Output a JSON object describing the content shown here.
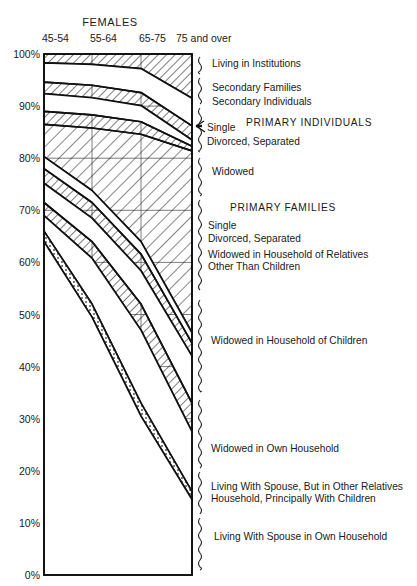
{
  "chart_title": "FEMALES",
  "axis": {
    "x_categories": [
      "45-54",
      "55-64",
      "65-75",
      "75 and over"
    ],
    "y_ticks": [
      "100%",
      "90%",
      "80%",
      "70%",
      "60%",
      "50%",
      "40%",
      "30%",
      "20%",
      "10%",
      "0%"
    ],
    "ylim": [
      0,
      100
    ],
    "grid": true
  },
  "annotations": {
    "living_in_institutions": "Living in Institutions",
    "secondary_families": "Secondary Families",
    "secondary_individuals": "Secondary Individuals",
    "group_primary_individuals": "PRIMARY  INDIVIDUALS",
    "pi_single": "Single",
    "pi_divorced": "Divorced, Separated",
    "pi_widowed": "Widowed",
    "group_primary_families": "PRIMARY  FAMILIES",
    "pf_single": "Single",
    "pf_divorced": "Divorced, Separated",
    "pf_widowed_rel_1": "Widowed in Household of Relatives",
    "pf_widowed_rel_2": "Other Than Children",
    "pf_widowed_children": "Widowed in Household of Children",
    "pf_widowed_own": "Widowed in Own Household",
    "pf_spouse_other_1": "Living With Spouse, But in Other Relatives",
    "pf_spouse_other_2": "Household, Principally With Children",
    "pf_spouse_own": "Living With Spouse in Own Household"
  },
  "chart_data": {
    "type": "area",
    "title": "FEMALES",
    "xlabel": "",
    "ylabel": "",
    "ylim": [
      0,
      100
    ],
    "grid": true,
    "legend_position": "right",
    "x": [
      "45-54",
      "55-64",
      "65-75",
      "75 and over"
    ],
    "note": "Stacked cumulative percent distribution of living arrangements of females by age group. Boundary values are cumulative percentages measured from 0% at bottom.",
    "boundaries_cumulative": [
      {
        "name": "top",
        "values": [
          100,
          100,
          100,
          100
        ]
      },
      {
        "name": "below Living in Institutions",
        "values": [
          98.3,
          98.0,
          97.2,
          91.5
        ]
      },
      {
        "name": "below Secondary Families",
        "values": [
          94.6,
          94.0,
          92.6,
          86.2
        ]
      },
      {
        "name": "below Secondary Individuals",
        "values": [
          92.4,
          91.6,
          90.1,
          83.5
        ]
      },
      {
        "name": "below PI Single",
        "values": [
          89.0,
          88.3,
          87.0,
          82.3
        ]
      },
      {
        "name": "below PI Divorced, Separated",
        "values": [
          86.5,
          85.8,
          84.6,
          81.4
        ]
      },
      {
        "name": "below PI Widowed",
        "values": [
          80.3,
          73.8,
          64.0,
          46.5
        ]
      },
      {
        "name": "below PF Single",
        "values": [
          78.0,
          71.5,
          61.6,
          44.5
        ]
      },
      {
        "name": "below PF Divorced, Separated",
        "values": [
          75.2,
          68.5,
          58.4,
          42.0
        ]
      },
      {
        "name": "below PF Widowed in Household of Relatives Other Than Children",
        "values": [
          71.5,
          64.0,
          52.0,
          33.0
        ]
      },
      {
        "name": "below PF Widowed in Household of Children",
        "values": [
          69.0,
          60.8,
          47.0,
          27.5
        ]
      },
      {
        "name": "below PF Widowed in Own Household",
        "values": [
          66.0,
          52.0,
          33.0,
          16.0
        ]
      },
      {
        "name": "below PF Living With Spouse But in Other Relatives Household",
        "values": [
          64.0,
          49.5,
          30.5,
          14.5
        ]
      },
      {
        "name": "bottom (Living With Spouse in Own Household)",
        "values": [
          0,
          0,
          0,
          0
        ]
      }
    ],
    "series": [
      {
        "name": "Living in Institutions",
        "values": [
          1.7,
          2.0,
          2.8,
          8.5
        ],
        "fill": "hatch"
      },
      {
        "name": "Secondary Families",
        "values": [
          3.7,
          4.0,
          4.6,
          5.3
        ],
        "fill": "blank"
      },
      {
        "name": "Secondary Individuals",
        "values": [
          2.2,
          2.4,
          2.5,
          2.7
        ],
        "fill": "hatch"
      },
      {
        "name": "Primary Individuals - Single",
        "values": [
          3.4,
          3.3,
          3.1,
          1.2
        ],
        "fill": "blank"
      },
      {
        "name": "Primary Individuals - Divorced, Separated",
        "values": [
          2.5,
          2.5,
          2.4,
          0.9
        ],
        "fill": "hatch"
      },
      {
        "name": "Primary Individuals - Widowed",
        "values": [
          6.2,
          12.0,
          20.6,
          34.9
        ],
        "fill": "hatch-large"
      },
      {
        "name": "Primary Families - Single",
        "values": [
          2.3,
          2.3,
          2.4,
          2.0
        ],
        "fill": "blank"
      },
      {
        "name": "Primary Families - Divorced, Separated",
        "values": [
          2.8,
          3.0,
          3.2,
          2.5
        ],
        "fill": "hatch"
      },
      {
        "name": "Widowed in Household of Relatives Other Than Children",
        "values": [
          3.7,
          4.5,
          6.4,
          9.0
        ],
        "fill": "blank"
      },
      {
        "name": "Widowed in Household of Children",
        "values": [
          2.5,
          3.2,
          5.0,
          5.5
        ],
        "fill": "hatch"
      },
      {
        "name": "Widowed in Own Household",
        "values": [
          3.0,
          8.8,
          14.0,
          11.5
        ],
        "fill": "blank"
      },
      {
        "name": "Living With Spouse, But in Other Relatives Household, Principally With Children",
        "values": [
          2.0,
          2.5,
          2.5,
          1.5
        ],
        "fill": "dotted-hatch"
      },
      {
        "name": "Living With Spouse in Own Household",
        "values": [
          64.0,
          49.5,
          30.5,
          14.5
        ],
        "fill": "blank"
      }
    ]
  }
}
